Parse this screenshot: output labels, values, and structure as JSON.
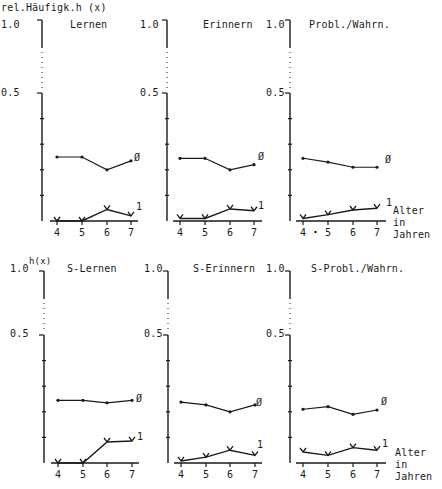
{
  "figure": {
    "ylabel_top": "rel.Häufigk.h (x)",
    "ylabel_bottom": "h(x)",
    "xlabel": [
      "Alter",
      "in",
      "Jahren"
    ],
    "series_labels": {
      "zero": "Ø",
      "one": "1"
    },
    "ytick_labels": {
      "top": "1.0",
      "mid": "0.5"
    },
    "xtick_labels": [
      "4",
      "5",
      "6",
      "7"
    ]
  },
  "chart_data": [
    {
      "type": "line",
      "title": "Lernen",
      "xlabel": "Alter in Jahren",
      "ylabel": "rel.Häufigk.h (x)",
      "x": [
        4,
        5,
        6,
        7
      ],
      "ylim": [
        0,
        1.0
      ],
      "yticks": [
        0,
        0.1,
        0.2,
        0.3,
        0.4,
        0.5,
        1.0
      ],
      "axis_break": "dotted between 0.5 and 1.0",
      "series": [
        {
          "name": "Ø",
          "values": [
            0.25,
            0.25,
            0.2,
            0.235
          ]
        },
        {
          "name": "1",
          "values": [
            0.0,
            0.0,
            0.045,
            0.02
          ]
        }
      ]
    },
    {
      "type": "line",
      "title": "Erinnern",
      "xlabel": "Alter in Jahren",
      "ylabel": "rel.Häufigk.h (x)",
      "x": [
        4,
        5,
        6,
        7
      ],
      "ylim": [
        0,
        1.0
      ],
      "series": [
        {
          "name": "Ø",
          "values": [
            0.245,
            0.245,
            0.2,
            0.22
          ]
        },
        {
          "name": "1",
          "values": [
            0.01,
            0.01,
            0.047,
            0.04
          ]
        }
      ]
    },
    {
      "type": "line",
      "title": "Probl./Wahrn.",
      "xlabel": "Alter in Jahren",
      "ylabel": "rel.Häufigk.h (x)",
      "x": [
        4,
        5,
        6,
        7
      ],
      "ylim": [
        0,
        1.0
      ],
      "series": [
        {
          "name": "Ø",
          "values": [
            0.245,
            0.23,
            0.21,
            0.21
          ]
        },
        {
          "name": "1",
          "values": [
            0.01,
            0.025,
            0.043,
            0.05
          ]
        }
      ]
    },
    {
      "type": "line",
      "title": "S-Lernen",
      "xlabel": "Alter in Jahren",
      "ylabel": "h(x)",
      "x": [
        4,
        5,
        6,
        7
      ],
      "ylim": [
        0,
        1.0
      ],
      "series": [
        {
          "name": "Ø",
          "values": [
            0.245,
            0.245,
            0.235,
            0.245
          ]
        },
        {
          "name": "1",
          "values": [
            0.0,
            0.0,
            0.082,
            0.086
          ]
        }
      ]
    },
    {
      "type": "line",
      "title": "S-Erinnern",
      "xlabel": "Alter in Jahren",
      "ylabel": "h(x)",
      "x": [
        4,
        5,
        6,
        7
      ],
      "ylim": [
        0,
        1.0
      ],
      "series": [
        {
          "name": "Ø",
          "values": [
            0.238,
            0.227,
            0.2,
            0.227
          ]
        },
        {
          "name": "1",
          "values": [
            0.008,
            0.023,
            0.05,
            0.03
          ]
        }
      ]
    },
    {
      "type": "line",
      "title": "S-Probl./Wahrn.",
      "xlabel": "Alter in Jahren",
      "ylabel": "h(x)",
      "x": [
        4,
        5,
        6,
        7
      ],
      "ylim": [
        0,
        1.0
      ],
      "series": [
        {
          "name": "Ø",
          "values": [
            0.21,
            0.22,
            0.19,
            0.207
          ]
        },
        {
          "name": "1",
          "values": [
            0.043,
            0.03,
            0.06,
            0.05
          ]
        }
      ]
    }
  ]
}
